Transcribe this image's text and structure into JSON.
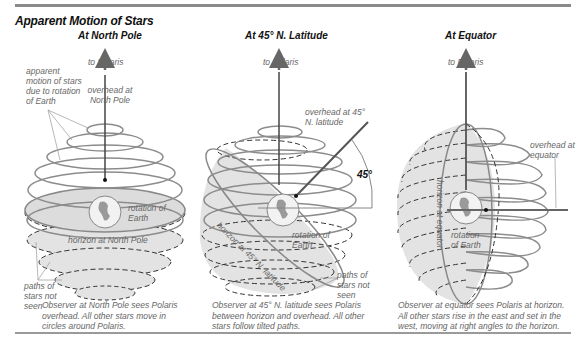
{
  "title": "Apparent Motion of Stars",
  "panels": [
    {
      "heading": "At North Pole",
      "labels": {
        "to_polaris": "to Polaris",
        "overhead": "overhead at North Pole",
        "apparent_motion": "apparent motion of stars due to rotation of Earth",
        "rotation": "rotation of Earth",
        "horizon": "horizon at North Pole",
        "paths_not_seen": "paths of stars not seen"
      },
      "caption": "Observer at North Pole sees Polaris overhead. All other stars move in circles around Polaris."
    },
    {
      "heading": "At 45° N. Latitude",
      "labels": {
        "to_polaris": "to Polaris",
        "overhead": "overhead at 45° N. latitude",
        "angle": "45°",
        "horizon": "horizon at 45° N. latitude",
        "rotation": "rotation of Earth",
        "paths_not_seen": "paths of stars not seen"
      },
      "caption": "Observer at 45° N. latitude sees Polaris between horizon and overhead. All other stars follow tilted paths."
    },
    {
      "heading": "At Equator",
      "labels": {
        "to_polaris": "to Polaris",
        "overhead": "overhead at equator",
        "horizon": "horizon at equator",
        "rotation": "rotation of Earth"
      },
      "caption": "Observer at equator sees Polaris at horizon. All other stars rise in the east and set in the west, moving at right angles to the horizon."
    }
  ],
  "colors": {
    "rule": "#8a8a8a",
    "star_path": "#8c8c8c",
    "shade": "#e2e2e2",
    "axis": "#555555",
    "label": "#666666",
    "heading": "#111111"
  }
}
